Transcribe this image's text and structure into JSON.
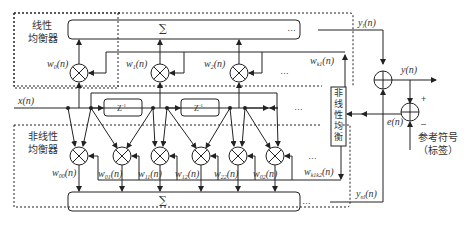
{
  "diagram": {
    "linear_equalizer": {
      "label_line1": "线性",
      "label_line2": "均衡器",
      "sum_symbol": "∑",
      "weights": [
        {
          "base": "w",
          "sub": "0",
          "arg": "(n)"
        },
        {
          "base": "w",
          "sub": "1",
          "arg": "(n)"
        },
        {
          "base": "w",
          "sub": "2",
          "arg": "(n)"
        },
        {
          "base": "w",
          "sub": "k1",
          "arg": "(n)"
        }
      ],
      "output": {
        "base": "y",
        "sub": "l",
        "arg": "(n)"
      }
    },
    "nonlinear_equalizer": {
      "label_line1": "非线性",
      "label_line2": "均衡器",
      "sum_symbol": "∑",
      "weights": [
        {
          "base": "w",
          "sub": "00",
          "arg": "(n)"
        },
        {
          "base": "w",
          "sub": "01",
          "arg": "(n)"
        },
        {
          "base": "w",
          "sub": "11",
          "arg": "(n)"
        },
        {
          "base": "w",
          "sub": "12",
          "arg": "(n)"
        },
        {
          "base": "w",
          "sub": "22",
          "arg": "(n)"
        },
        {
          "base": "w",
          "sub": "02",
          "arg": "(n)"
        },
        {
          "base": "w",
          "sub": "k1k2",
          "arg": "(n)"
        }
      ],
      "output": {
        "base": "y",
        "sub": "nl",
        "arg": "(n)"
      }
    },
    "adaptation_block": {
      "label": "非线性均衡器",
      "chars": [
        "非",
        "线",
        "性",
        "均",
        "衡",
        "器"
      ]
    },
    "input": {
      "base": "x",
      "arg": "(n)"
    },
    "delays": [
      {
        "label": "Z",
        "exp": "-1"
      },
      {
        "label": "Z",
        "exp": "-1"
      }
    ],
    "output": {
      "base": "y",
      "arg": "(n)"
    },
    "error": {
      "base": "e",
      "arg": "(n)"
    },
    "reference": {
      "line1": "参考符号",
      "line2": "（标签）"
    },
    "signs": {
      "plus": "+",
      "minus": "–"
    },
    "ellipsis": "…"
  }
}
